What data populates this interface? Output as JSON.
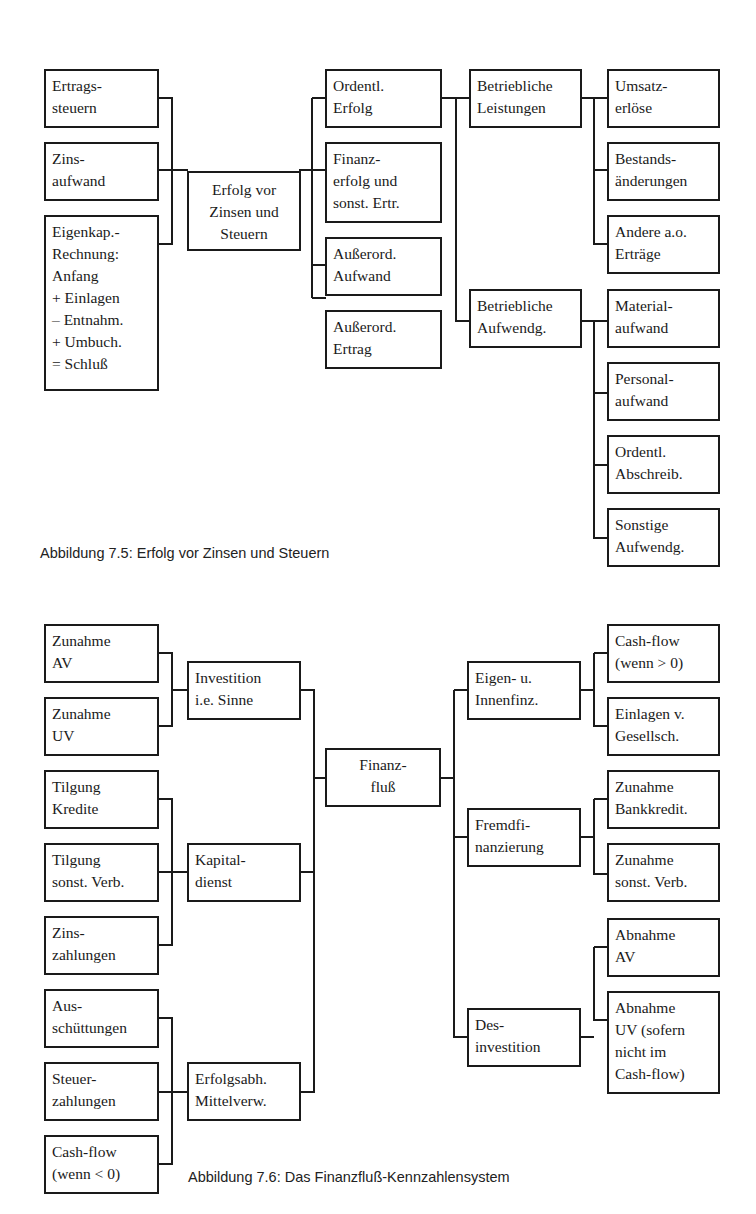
{
  "figure_7_5": {
    "caption": "Abbildung 7.5: Erfolg vor Zinsen und Steuern",
    "root": "Erfolg vor\nZinsen und\nSteuern",
    "left_inputs": [
      "Ertrags-\nsteuern",
      "Zins-\naufwand",
      "Eigenkap.-\nRechnung:\nAnfang\n+ Einlagen\n– Entnahm.\n+ Umbuch.\n= Schluß"
    ],
    "level1": [
      "Ordentl.\nErfolg",
      "Finanz-\nerfolg und\nsonst. Ertr.",
      "Außerord.\nAufwand",
      "Außerord.\nErtrag"
    ],
    "level2": [
      "Betriebliche\nLeistungen",
      "Betriebliche\nAufwendg."
    ],
    "leistungen_children": [
      "Umsatz-\nerlöse",
      "Bestands-\nänderungen",
      "Andere a.o.\nErträge"
    ],
    "aufwendungen_children": [
      "Material-\naufwand",
      "Personal-\naufwand",
      "Ordentl.\nAbschreib.",
      "Sonstige\nAufwendg."
    ]
  },
  "figure_7_6": {
    "caption": "Abbildung 7.6: Das Finanzfluß-Kennzahlensystem",
    "root": "Finanz-\nfluß",
    "investition": {
      "label": "Investition\ni.e. Sinne",
      "children": [
        "Zunahme\nAV",
        "Zunahme\nUV"
      ]
    },
    "kapitaldienst": {
      "label": "Kapital-\ndienst",
      "children": [
        "Tilgung\nKredite",
        "Tilgung\nsonst. Verb.",
        "Zins-\nzahlungen"
      ]
    },
    "erfolgsabh": {
      "label": "Erfolgsabh.\nMittelverw.",
      "children": [
        "Aus-\nschüttungen",
        "Steuer-\nzahlungen",
        "Cash-flow\n(wenn < 0)"
      ]
    },
    "eigen": {
      "label": "Eigen- u.\nInnenfinz.",
      "children": [
        "Cash-flow\n(wenn > 0)",
        "Einlagen v.\nGesellsch."
      ]
    },
    "fremd": {
      "label": "Fremdfi-\nnanzierung",
      "children": [
        "Zunahme\nBankkredit.",
        "Zunahme\nsonst. Verb."
      ]
    },
    "des": {
      "label": "Des-\ninvestition",
      "children": [
        "Abnahme\nAV",
        "Abnahme\nUV (sofern\nnicht im\nCash-flow)"
      ]
    }
  }
}
